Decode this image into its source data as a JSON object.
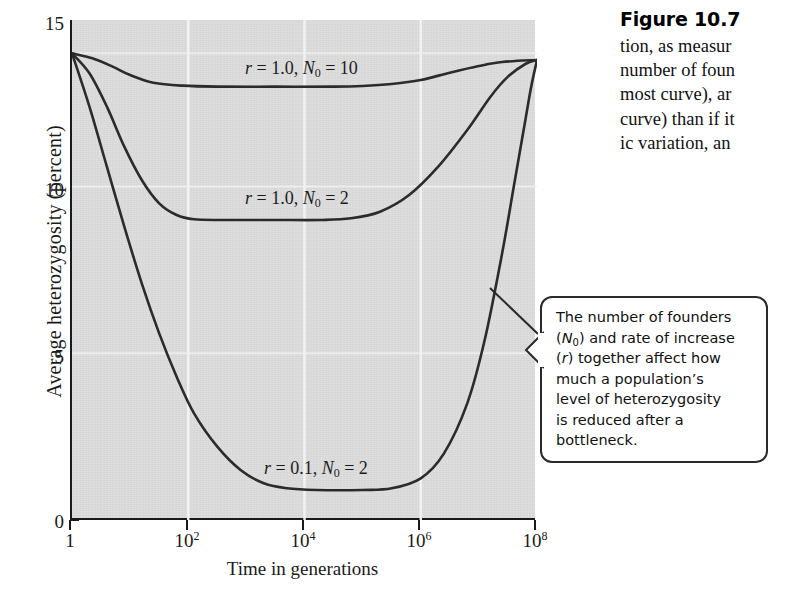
{
  "figure": {
    "caption_title": "Figure 10.7",
    "caption_lines": [
      "tion, as measur",
      "number of foun",
      "most curve), ar",
      "curve) than if it",
      "ic variation, an"
    ]
  },
  "callout": {
    "lines": [
      "The number of founders",
      "(N0) and rate of increase",
      "(r) together affect how",
      "much a population’s",
      "level of heterozygosity",
      "is reduced after a",
      "bottleneck."
    ],
    "text": "The number of founders (N0) and rate of increase (r) together affect how much a population’s level of heterozygosity is reduced after a bottleneck."
  },
  "chart_data": {
    "type": "line",
    "title": "",
    "xlabel": "Time in generations",
    "ylabel": "Average heterozygosity (percent)",
    "xscale": "log",
    "xlim": [
      1,
      100000000
    ],
    "ylim": [
      0,
      15
    ],
    "yticks": [
      0,
      5,
      10,
      15
    ],
    "ytick_labels": [
      "0",
      "5",
      "10",
      "15"
    ],
    "xticks": [
      1,
      100,
      10000,
      1000000,
      100000000
    ],
    "xtick_labels": [
      "1",
      "10²",
      "10⁴",
      "10⁶",
      "10⁸"
    ],
    "xtick_bases": [
      "1",
      "10",
      "10",
      "10",
      "10"
    ],
    "xtick_exponents": [
      "",
      "2",
      "4",
      "6",
      "8"
    ],
    "grid": "vertical white gridlines at decade ticks",
    "legend": "inline curve labels",
    "plot_background": "#dcdcdc",
    "curve_color": "#2b2b2b",
    "series": [
      {
        "name": "r = 1.0, N0 = 10",
        "r": "1.0",
        "N0": "10",
        "label_html": "<i>r</i> = 1.0, <i>N</i><sub>0</sub> = 10",
        "start_value": 14.0,
        "plateau_value": 13.0,
        "end_value": 13.8,
        "points": [
          [
            0,
            14.0
          ],
          [
            0.35,
            13.85
          ],
          [
            0.7,
            13.6
          ],
          [
            1.0,
            13.35
          ],
          [
            1.4,
            13.12
          ],
          [
            1.9,
            13.03
          ],
          [
            2.5,
            13.0
          ],
          [
            3.5,
            13.0
          ],
          [
            4.5,
            13.0
          ],
          [
            5.0,
            13.02
          ],
          [
            5.5,
            13.08
          ],
          [
            6.0,
            13.2
          ],
          [
            6.5,
            13.42
          ],
          [
            7.0,
            13.62
          ],
          [
            7.4,
            13.74
          ],
          [
            8.0,
            13.8
          ]
        ]
      },
      {
        "name": "r = 1.0, N0 = 2",
        "r": "1.0",
        "N0": "2",
        "label_html": "<i>r</i> = 1.0, <i>N</i><sub>0</sub> = 2",
        "start_value": 14.0,
        "plateau_value": 9.0,
        "end_value": 13.8,
        "points": [
          [
            0,
            14.0
          ],
          [
            0.3,
            13.4
          ],
          [
            0.6,
            12.4
          ],
          [
            0.9,
            11.2
          ],
          [
            1.2,
            10.2
          ],
          [
            1.5,
            9.5
          ],
          [
            1.8,
            9.15
          ],
          [
            2.1,
            9.02
          ],
          [
            2.6,
            9.0
          ],
          [
            3.5,
            9.0
          ],
          [
            4.3,
            9.0
          ],
          [
            4.8,
            9.05
          ],
          [
            5.3,
            9.25
          ],
          [
            5.8,
            9.75
          ],
          [
            6.3,
            10.6
          ],
          [
            6.8,
            11.7
          ],
          [
            7.2,
            12.7
          ],
          [
            7.5,
            13.3
          ],
          [
            7.8,
            13.68
          ],
          [
            8.0,
            13.8
          ]
        ]
      },
      {
        "name": "r = 0.1, N0 = 2",
        "r": "0.1",
        "N0": "2",
        "label_html": "<i>r</i> = 0.1, <i>N</i><sub>0</sub> = 2",
        "start_value": 14.0,
        "plateau_value": 0.9,
        "end_value": 13.8,
        "points": [
          [
            0,
            14.0
          ],
          [
            0.3,
            12.4
          ],
          [
            0.6,
            10.6
          ],
          [
            0.9,
            8.8
          ],
          [
            1.2,
            7.1
          ],
          [
            1.5,
            5.6
          ],
          [
            1.8,
            4.3
          ],
          [
            2.1,
            3.2
          ],
          [
            2.5,
            2.2
          ],
          [
            2.9,
            1.5
          ],
          [
            3.3,
            1.1
          ],
          [
            3.7,
            0.95
          ],
          [
            4.2,
            0.9
          ],
          [
            5.0,
            0.9
          ],
          [
            5.5,
            0.95
          ],
          [
            6.0,
            1.25
          ],
          [
            6.4,
            2.0
          ],
          [
            6.8,
            3.5
          ],
          [
            7.1,
            5.4
          ],
          [
            7.4,
            8.0
          ],
          [
            7.6,
            10.0
          ],
          [
            7.8,
            12.0
          ],
          [
            7.9,
            13.0
          ],
          [
            8.0,
            13.8
          ]
        ]
      }
    ],
    "series_label_positions": [
      {
        "name": "r = 1.0, N0 = 10",
        "x_left_px": 243,
        "y_top_px": 58
      },
      {
        "name": "r = 1.0, N0 = 2",
        "x_left_px": 243,
        "y_top_px": 188
      },
      {
        "name": "r = 0.1, N0 = 2",
        "x_left_px": 262,
        "y_top_px": 458
      }
    ]
  }
}
